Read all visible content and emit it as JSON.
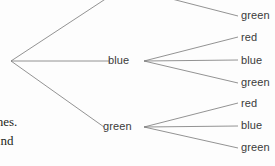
{
  "diagram": {
    "type": "probability-tree",
    "title": "",
    "colors": {
      "background": "#fdfdfd",
      "branch_line": "#777777",
      "label_text": "#3a3a3a",
      "body_text": "#231f20"
    },
    "root": {
      "name": "root-node",
      "x": 11,
      "y": 61
    },
    "interior_nodes": [
      {
        "name": "node-blue",
        "label": "blue",
        "x": 122,
        "y": 61,
        "fan_x": 144
      },
      {
        "name": "node-green",
        "label": "green",
        "x": 120,
        "y": 127,
        "fan_x": 144
      }
    ],
    "leaves": [
      {
        "label": "green",
        "x": 241,
        "y": 16,
        "parent": "offscreen-top"
      },
      {
        "label": "red",
        "x": 241,
        "y": 38,
        "parent": "node-blue"
      },
      {
        "label": "blue",
        "x": 241,
        "y": 61,
        "parent": "node-blue"
      },
      {
        "label": "green",
        "x": 241,
        "y": 83,
        "parent": "node-blue"
      },
      {
        "label": "red",
        "x": 241,
        "y": 104,
        "parent": "node-green"
      },
      {
        "label": "blue",
        "x": 241,
        "y": 126,
        "parent": "node-green"
      },
      {
        "label": "green",
        "x": 241,
        "y": 148,
        "parent": "node-green"
      }
    ],
    "branches": [
      {
        "name": "root-to-offscreen-top",
        "x1": 11,
        "y1": 61,
        "x2": 107,
        "y2": -2
      },
      {
        "name": "root-to-blue",
        "x1": 11,
        "y1": 61,
        "x2": 110,
        "y2": 61
      },
      {
        "name": "root-to-green",
        "x1": 11,
        "y1": 61,
        "x2": 104,
        "y2": 127
      },
      {
        "name": "offscreen-to-green-1",
        "x1": 168,
        "y1": -2,
        "x2": 238,
        "y2": 16
      },
      {
        "name": "blue-to-red",
        "x1": 144,
        "y1": 61,
        "x2": 238,
        "y2": 37
      },
      {
        "name": "blue-to-blue",
        "x1": 144,
        "y1": 61,
        "x2": 238,
        "y2": 60
      },
      {
        "name": "blue-to-green",
        "x1": 144,
        "y1": 61,
        "x2": 238,
        "y2": 83
      },
      {
        "name": "green-to-red",
        "x1": 144,
        "y1": 127,
        "x2": 238,
        "y2": 103
      },
      {
        "name": "green-to-blue",
        "x1": 144,
        "y1": 127,
        "x2": 238,
        "y2": 126
      },
      {
        "name": "green-to-green",
        "x1": 144,
        "y1": 127,
        "x2": 238,
        "y2": 148
      }
    ]
  },
  "body_text": {
    "line1": "ches.",
    "line2": "land"
  }
}
